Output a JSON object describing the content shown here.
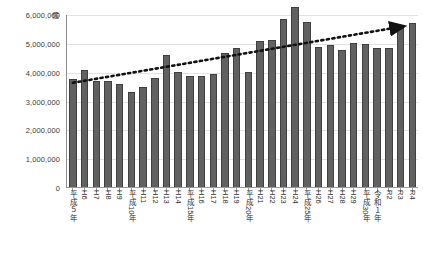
{
  "chart_data": {
    "type": "bar",
    "title": "",
    "subtitle": "",
    "unit_label": "億",
    "xlabel": "",
    "ylabel": "",
    "ylim": [
      0,
      6000000
    ],
    "y_ticks": [
      0,
      1000000,
      2000000,
      3000000,
      4000000,
      5000000,
      6000000
    ],
    "y_tick_labels": [
      "0",
      "1,000,000",
      "2,000,000",
      "3,000,000",
      "4,000,000",
      "5,000,000",
      "6,000,000"
    ],
    "grid": true,
    "legend": "none",
    "bar_color": "#616161",
    "categories": [
      "平成５年",
      "H6",
      "H7",
      "H8",
      "H9",
      "平成10年",
      "H11",
      "H12",
      "H13",
      "H14",
      "平成15年",
      "H16",
      "H17",
      "H18",
      "H19",
      "平成20年",
      "H21",
      "H22",
      "H23",
      "H24",
      "平成25年",
      "H26",
      "H27",
      "H28",
      "H29",
      "平成30年",
      "令和１年",
      "R2",
      "R3",
      "R4"
    ],
    "values": [
      3780000,
      4100000,
      3700000,
      3700000,
      3600000,
      3330000,
      3520000,
      3830000,
      4620000,
      4030000,
      3900000,
      3900000,
      3950000,
      4680000,
      4870000,
      4030000,
      5100000,
      5150000,
      5870000,
      6280000,
      5750000,
      4890000,
      4950000,
      4790000,
      5040000,
      5000000,
      4870000,
      4870000,
      5650000,
      5720000
    ],
    "series_name": "",
    "annotations": {
      "trendline": {
        "style": "dotted",
        "color": "#111111",
        "arrow": true,
        "start_value": 3650000,
        "end_value": 5600000,
        "description": "dotted upward trend arrow from left to right"
      }
    }
  }
}
